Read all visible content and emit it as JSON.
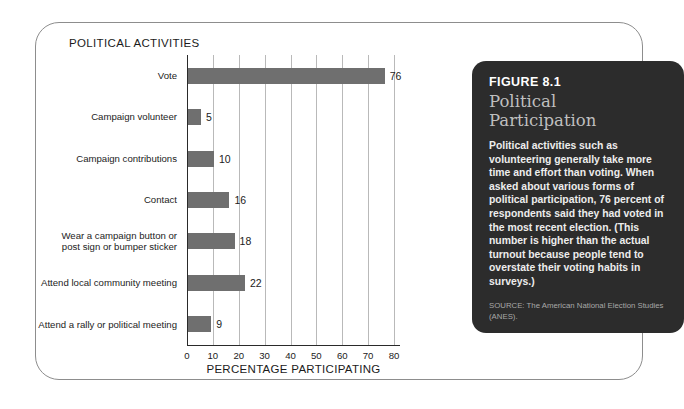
{
  "chart": {
    "title": "POLITICAL ACTIVITIES",
    "xlabel": "PERCENTAGE PARTICIPATING"
  },
  "caption": {
    "figure_number": "FIGURE 8.1",
    "title": "Political\nParticipation",
    "body": "Political activities such as volunteering generally take more time and effort than voting. When asked about various forms of political participation, 76 percent of respondents said they had voted in the most recent election. (This number is higher than the actual turnout because people tend to overstate their voting habits in surveys.)",
    "source": "SOURCE: The American National Election Studies (ANES)."
  },
  "colors": {
    "bar": "#6f6f6f",
    "panel_background": "#2c2c2c",
    "card_border": "#8d8d8d",
    "gridline": "#b9b9b9",
    "axis": "#2a2a2a"
  },
  "chart_data": {
    "type": "bar",
    "orientation": "horizontal",
    "title": "POLITICAL ACTIVITIES",
    "xlabel": "PERCENTAGE PARTICIPATING",
    "ylabel": "",
    "xlim": [
      0,
      80
    ],
    "xticks": [
      0,
      10,
      20,
      30,
      40,
      50,
      60,
      70,
      80
    ],
    "grid": true,
    "legend": false,
    "data_labels": true,
    "categories": [
      "Vote",
      "Campaign volunteer",
      "Campaign contributions",
      "Contact",
      "Wear a campaign button or\npost sign or bumper sticker",
      "Attend local community meeting",
      "Attend a rally or political meeting"
    ],
    "values": [
      76,
      5,
      10,
      16,
      18,
      22,
      9
    ]
  }
}
